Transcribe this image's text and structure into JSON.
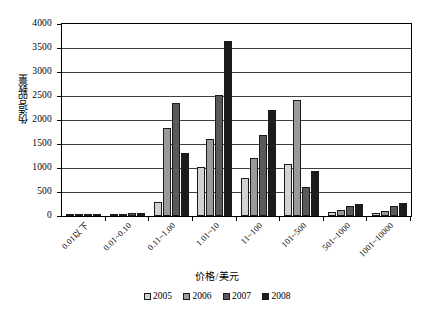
{
  "chart_data": {
    "type": "bar",
    "title": "",
    "xlabel": "价格/美元",
    "ylabel": "伪造品数量",
    "ylim": [
      0,
      4000
    ],
    "ytick_step": 500,
    "yticks": [
      "0",
      "500",
      "1000",
      "1500",
      "2000",
      "2500",
      "3000",
      "3500",
      "4000"
    ],
    "grid": true,
    "legend_position": "bottom",
    "categories": [
      "0.01以下",
      "0.01~0.10",
      "0.11~1.00",
      "1.01~10",
      "11~100",
      "101~500",
      "501~1000",
      "1001~10000"
    ],
    "series": [
      {
        "name": "2005",
        "color": "#d2d2d2",
        "values": [
          5,
          25,
          300,
          1020,
          800,
          1080,
          80,
          70
        ]
      },
      {
        "name": "2006",
        "color": "#9a9a9a",
        "values": [
          8,
          40,
          1830,
          1600,
          1200,
          2420,
          130,
          110
        ]
      },
      {
        "name": "2007",
        "color": "#5a5a5a",
        "values": [
          10,
          55,
          2350,
          2520,
          1680,
          600,
          200,
          200
        ]
      },
      {
        "name": "2008",
        "color": "#1c1c1c",
        "values": [
          30,
          60,
          1320,
          3640,
          2200,
          940,
          240,
          280
        ]
      }
    ]
  }
}
